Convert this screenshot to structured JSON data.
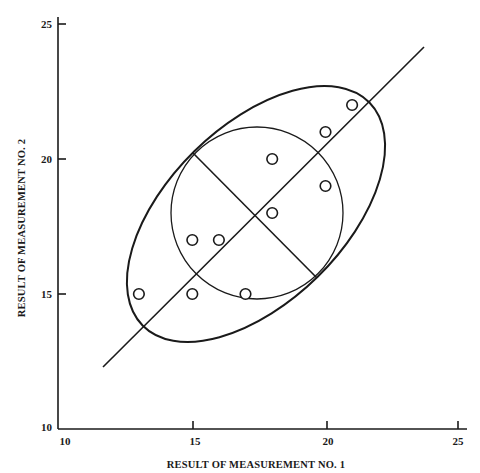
{
  "chart_data": {
    "type": "scatter",
    "title": "",
    "xlabel": "RESULT OF MEASUREMENT NO. 1",
    "ylabel": "RESULT OF MEASUREMENT NO. 2",
    "xlim": [
      10,
      25
    ],
    "ylim": [
      10,
      25
    ],
    "x_ticks": [
      10,
      15,
      20,
      25
    ],
    "y_ticks": [
      10,
      15,
      20,
      25
    ],
    "grid": false,
    "legend": null,
    "series": [
      {
        "name": "measurements",
        "marker": "open-circle",
        "points": [
          {
            "x": 13,
            "y": 15
          },
          {
            "x": 15,
            "y": 15
          },
          {
            "x": 17,
            "y": 15
          },
          {
            "x": 15,
            "y": 17
          },
          {
            "x": 16,
            "y": 17
          },
          {
            "x": 18,
            "y": 18
          },
          {
            "x": 18,
            "y": 20
          },
          {
            "x": 20,
            "y": 19
          },
          {
            "x": 20,
            "y": 21
          },
          {
            "x": 21,
            "y": 22
          }
        ]
      }
    ],
    "annotations": [
      {
        "type": "line",
        "name": "major-axis-line",
        "from": {
          "x": 11.6,
          "y": 12.3
        },
        "to": {
          "x": 23.6,
          "y": 24.1
        }
      },
      {
        "type": "ellipse",
        "name": "outer-ellipse",
        "center": {
          "x": 17.4,
          "y": 17.9
        },
        "semi_major": 6.0,
        "semi_minor": 3.3,
        "angle_deg": 45
      },
      {
        "type": "circle",
        "name": "inner-circle",
        "center": {
          "x": 17.4,
          "y": 17.9
        },
        "radius": 3.2
      },
      {
        "type": "line",
        "name": "minor-axis-line",
        "from": {
          "x": 15.0,
          "y": 20.2
        },
        "to": {
          "x": 19.6,
          "y": 15.6
        }
      }
    ]
  },
  "colors": {
    "ink": "#1a1a1a",
    "background": "#ffffff"
  }
}
